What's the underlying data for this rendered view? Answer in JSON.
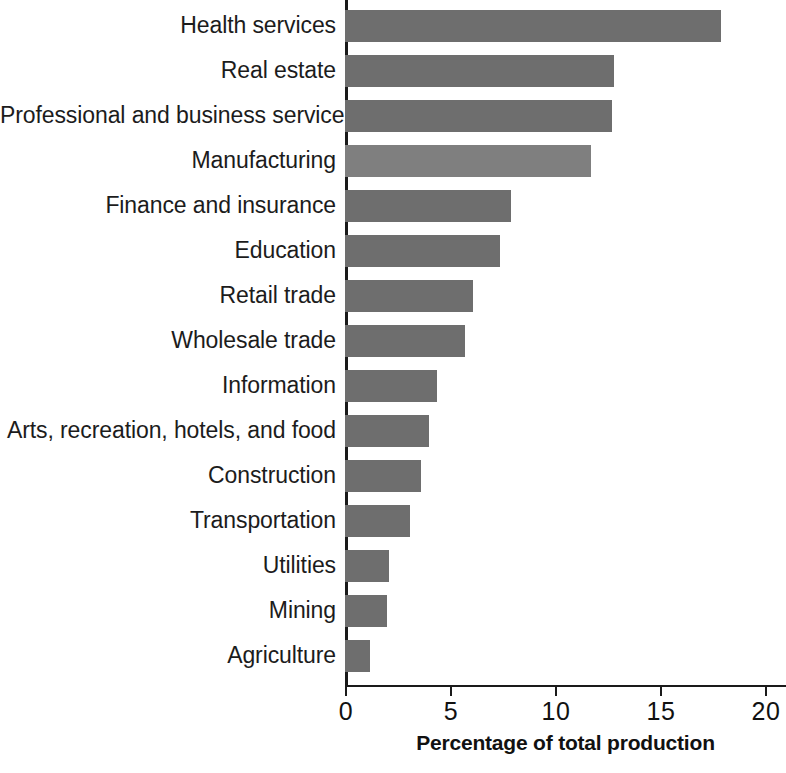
{
  "chart_data": {
    "type": "bar",
    "orientation": "horizontal",
    "title": "",
    "subtitle": "",
    "xlabel": "Percentage of total production",
    "ylabel": "",
    "xlim": [
      0,
      21
    ],
    "xticks": [
      0,
      5,
      10,
      15,
      20
    ],
    "xtick_labels": [
      "0",
      "5",
      "10",
      "15",
      "20"
    ],
    "grid": false,
    "legend": null,
    "categories": [
      "Health services",
      "Real estate",
      "Professional and business services",
      "Manufacturing",
      "Finance and insurance",
      "Education",
      "Retail trade",
      "Wholesale trade",
      "Information",
      "Arts, recreation, hotels, and food",
      "Construction",
      "Transportation",
      "Utilities",
      "Mining",
      "Agriculture"
    ],
    "values": [
      17.9,
      12.8,
      12.7,
      11.7,
      7.9,
      7.4,
      6.1,
      5.7,
      4.4,
      4.0,
      3.6,
      3.1,
      2.1,
      2.0,
      1.2
    ],
    "highlighted_category": "Manufacturing",
    "colors": {
      "bar": "#6e6e6e",
      "bar_highlight": "#7f7f7f",
      "axis": "#1a1a1a",
      "text": "#1c1c1c",
      "background": "#ffffff"
    }
  }
}
